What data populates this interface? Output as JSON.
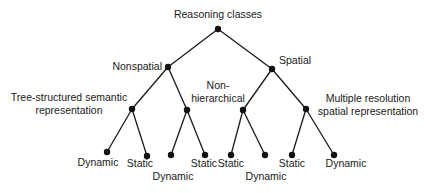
{
  "diagram": {
    "type": "tree",
    "root": {
      "label": "Reasoning classes",
      "children": [
        {
          "label": "Nonspatial",
          "children": [
            {
              "label": "Tree-structured semantic representation",
              "children": [
                {
                  "label": "Dynamic"
                },
                {
                  "label": "Static"
                }
              ]
            },
            {
              "label": "",
              "children": [
                {
                  "label": "Dynamic"
                },
                {
                  "label": "Static"
                }
              ]
            }
          ]
        },
        {
          "label": "Spatial",
          "children": [
            {
              "label": "Non-hierarchical",
              "children": [
                {
                  "label": "Static"
                },
                {
                  "label": "Dynamic"
                }
              ]
            },
            {
              "label": "Multiple resolution spatial representation",
              "children": [
                {
                  "label": "Static"
                },
                {
                  "label": "Dynamic"
                }
              ]
            }
          ]
        }
      ]
    },
    "labels": {
      "root": "Reasoning classes",
      "nonspatial": "Nonspatial",
      "spatial": "Spatial",
      "tree_structured_line1": "Tree-structured semantic",
      "tree_structured_line2": "representation",
      "non_hierarchical_line1": "Non-",
      "non_hierarchical_line2": "hierarchical",
      "multi_res_line1": "Multiple resolution",
      "multi_res_line2": "spatial representation",
      "leaves": [
        "Dynamic",
        "Static",
        "Dynamic",
        "Static",
        "Static",
        "Dynamic",
        "Static",
        "Dynamic"
      ]
    }
  }
}
